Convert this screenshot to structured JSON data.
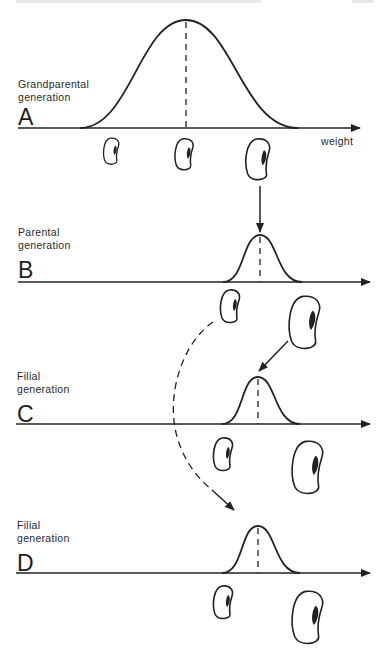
{
  "figure": {
    "panels": [
      {
        "letter": "A",
        "generation": [
          "Grandparental",
          "generation"
        ]
      },
      {
        "letter": "B",
        "generation": [
          "Parental",
          "generation"
        ]
      },
      {
        "letter": "C",
        "generation": [
          "Filial",
          "generation"
        ]
      },
      {
        "letter": "D",
        "generation": [
          "Filial",
          "generation"
        ]
      }
    ],
    "axis_label": "weight"
  },
  "colors": {
    "ink": "#222222",
    "background": "#ffffff"
  }
}
